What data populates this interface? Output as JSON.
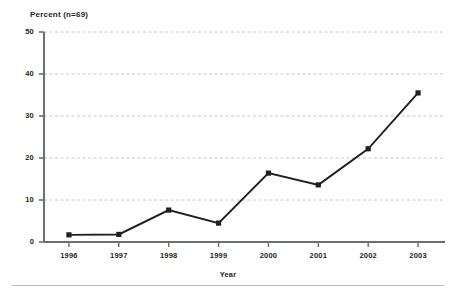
{
  "chart_data": {
    "type": "line",
    "title": "",
    "ylabel": "Percent (n=69)",
    "xlabel": "Year",
    "categories": [
      "1996",
      "1997",
      "1998",
      "1999",
      "2000",
      "2001",
      "2002",
      "2003"
    ],
    "values": [
      1.7,
      1.8,
      7.6,
      4.5,
      16.4,
      13.6,
      22.2,
      35.5
    ],
    "series": [
      {
        "name": "Percent",
        "values": [
          1.7,
          1.8,
          7.6,
          4.5,
          16.4,
          13.6,
          22.2,
          35.5
        ]
      }
    ],
    "ylim": [
      0,
      50
    ],
    "yticks": [
      0,
      10,
      20,
      30,
      40,
      50
    ],
    "ytick_labels": [
      "0",
      "10",
      "20",
      "30",
      "40",
      "50"
    ],
    "xtick_labels": [
      "1996",
      "1997",
      "1998",
      "1999",
      "2000",
      "2001",
      "2002",
      "2003"
    ],
    "grid": true,
    "grid_axis": "y",
    "grid_style": "dashed",
    "legend": false,
    "legend_position": "none",
    "marker": "square",
    "line_color": "#231f20",
    "marker_color": "#231f20",
    "grid_color": "#b7b7b7",
    "axis_color": "#6d6e70",
    "background_color": "#ffffff"
  },
  "axes": {
    "y_title": "Percent (n=69)",
    "x_title": "Year",
    "y_ticks": [
      {
        "label": "50",
        "value": 50
      },
      {
        "label": "40",
        "value": 40
      },
      {
        "label": "30",
        "value": 30
      },
      {
        "label": "20",
        "value": 20
      },
      {
        "label": "10",
        "value": 10
      },
      {
        "label": "0",
        "value": 0
      }
    ],
    "x_ticks": [
      {
        "label": "1996"
      },
      {
        "label": "1997"
      },
      {
        "label": "1998"
      },
      {
        "label": "1999"
      },
      {
        "label": "2000"
      },
      {
        "label": "2001"
      },
      {
        "label": "2002"
      },
      {
        "label": "2003"
      }
    ]
  }
}
